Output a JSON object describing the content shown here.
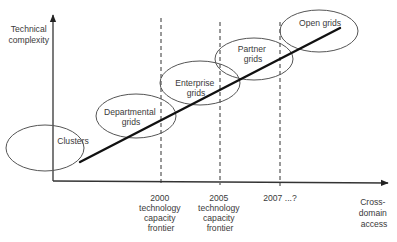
{
  "diagram": {
    "y_axis_label": [
      "Technical",
      "complexity"
    ],
    "x_axis_label": [
      "Cross-",
      "domain",
      "access"
    ],
    "stages": [
      {
        "name": "clusters",
        "lines": [
          "Clusters"
        ]
      },
      {
        "name": "departmental-grids",
        "lines": [
          "Departmental",
          "grids"
        ]
      },
      {
        "name": "enterprise-grids",
        "lines": [
          "Enterprise",
          "grids"
        ]
      },
      {
        "name": "partner-grids",
        "lines": [
          "Partner",
          "grids"
        ]
      },
      {
        "name": "open-grids",
        "lines": [
          "Open grids"
        ]
      }
    ],
    "frontiers": [
      {
        "name": "frontier-2000",
        "lines": [
          "2000",
          "technology",
          "capacity",
          "frontier"
        ]
      },
      {
        "name": "frontier-2005",
        "lines": [
          "2005",
          "technology",
          "capacity",
          "frontier"
        ]
      },
      {
        "name": "frontier-2007",
        "lines": [
          "2007 ...?"
        ]
      }
    ],
    "trend": "increasing"
  }
}
